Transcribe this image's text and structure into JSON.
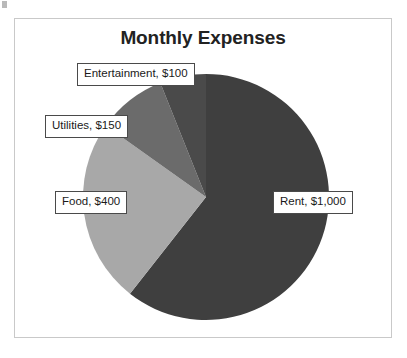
{
  "chart_data": {
    "type": "pie",
    "title": "Monthly Expenses",
    "xlabel": "",
    "ylabel": "",
    "currency": "$",
    "total": 1650,
    "legend_position": "none",
    "grid": false,
    "start_angle_deg": 0,
    "direction": "clockwise",
    "categories": [
      "Rent",
      "Food",
      "Utilities",
      "Entertainment"
    ],
    "values": [
      1000,
      400,
      150,
      100
    ],
    "labels": [
      "Rent, $1,000",
      "Food, $400",
      "Utilities, $150",
      "Entertainment, $100"
    ],
    "slices": [
      {
        "name": "Rent",
        "value": 1000,
        "value_text": "$1,000",
        "label": "Rent, $1,000",
        "percent": 60.6,
        "sweep_deg": 218.2,
        "color": "#3f3f3f"
      },
      {
        "name": "Food",
        "value": 400,
        "value_text": "$400",
        "label": "Food, $400",
        "percent": 24.2,
        "sweep_deg": 87.3,
        "color": "#a8a8a8"
      },
      {
        "name": "Utilities",
        "value": 150,
        "value_text": "$150",
        "label": "Utilities, $150",
        "percent": 9.1,
        "sweep_deg": 32.7,
        "color": "#6b6b6b"
      },
      {
        "name": "Entertainment",
        "value": 100,
        "value_text": "$100",
        "label": "Entertainment, $100",
        "percent": 6.1,
        "sweep_deg": 21.8,
        "color": "#4a4a4a"
      }
    ]
  },
  "frame": {
    "border_color": "#c9c9c9",
    "background": "#ffffff"
  },
  "title": {
    "text": "Monthly Expenses",
    "color": "#222222"
  }
}
